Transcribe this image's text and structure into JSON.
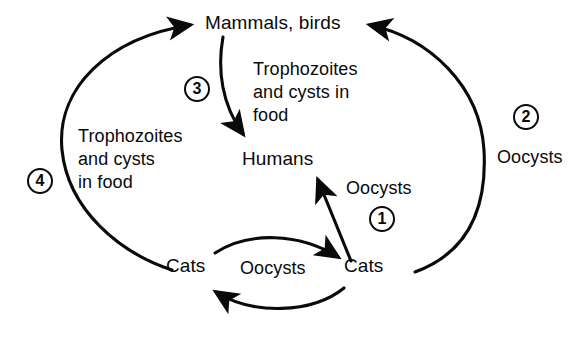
{
  "diagram": {
    "stroke_color": "#0a0a0a",
    "background_color": "#ffffff",
    "nodes": [
      {
        "id": "mammals_birds",
        "label": "Mammals, birds"
      },
      {
        "id": "humans",
        "label": "Humans"
      },
      {
        "id": "cats_left",
        "label": "Cats"
      },
      {
        "id": "cats_right",
        "label": "Cats"
      }
    ],
    "edge_labels": [
      {
        "id": "trophozoites_to_humans",
        "line1": "Trophozoites",
        "line2": "and cysts in",
        "line3": "food"
      },
      {
        "id": "trophozoites_to_mammals",
        "line1": "Trophozoites",
        "line2": "and cysts",
        "line3": "in food"
      },
      {
        "id": "oocysts_to_humans",
        "text": "Oocysts"
      },
      {
        "id": "oocysts_to_mammals",
        "text": "Oocysts"
      },
      {
        "id": "oocysts_cats_cycle",
        "text": "Oocysts"
      }
    ],
    "steps": [
      {
        "id": "step-1",
        "number": "1",
        "meaning": "Oocysts from cats to humans"
      },
      {
        "id": "step-2",
        "number": "2",
        "meaning": "Oocysts from cats to mammals and birds"
      },
      {
        "id": "step-3",
        "number": "3",
        "meaning": "Trophozoites and cysts in food from mammals and birds to humans"
      },
      {
        "id": "step-4",
        "number": "4",
        "meaning": "Trophozoites and cysts in food from cats to mammals and birds"
      }
    ]
  }
}
